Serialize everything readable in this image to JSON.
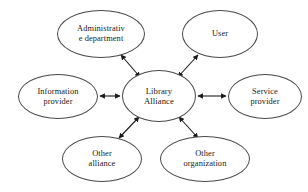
{
  "diagram": {
    "type": "hub-and-spoke network diagram",
    "background_color": "#ffffff",
    "node_stroke_color": "#4a4a4a",
    "edge_color": "#1a1a1a",
    "text_color": "#1a1a1a",
    "center": {
      "id": "library-alliance",
      "label": "Library\nAlliance"
    },
    "nodes": [
      {
        "id": "administrative-department",
        "label": "Administrativ\ne department"
      },
      {
        "id": "user",
        "label": "User"
      },
      {
        "id": "information-provider",
        "label": "Information\nprovider"
      },
      {
        "id": "service-provider",
        "label": "Service\nprovider"
      },
      {
        "id": "other-alliance",
        "label": "Other\nalliance"
      },
      {
        "id": "other-organization",
        "label": "Other\norganization"
      }
    ],
    "edges": [
      {
        "from": "library-alliance",
        "to": "administrative-department",
        "style": "double-headed-arrow"
      },
      {
        "from": "library-alliance",
        "to": "user",
        "style": "double-headed-arrow"
      },
      {
        "from": "library-alliance",
        "to": "information-provider",
        "style": "double-headed-arrow"
      },
      {
        "from": "library-alliance",
        "to": "service-provider",
        "style": "double-headed-arrow"
      },
      {
        "from": "library-alliance",
        "to": "other-alliance",
        "style": "double-headed-arrow"
      },
      {
        "from": "library-alliance",
        "to": "other-organization",
        "style": "double-headed-arrow"
      }
    ]
  }
}
